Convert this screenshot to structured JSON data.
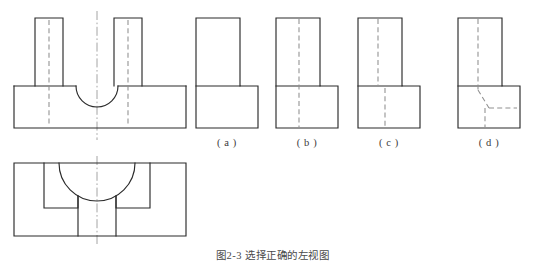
{
  "figure": {
    "type": "engineering-orthographic-projection-exercise",
    "caption": "图2-3  选择正确的左视图",
    "caption_visible": "partially-cropped-at-bottom-edge",
    "line_styles": {
      "visible_edge": "#2b2b2b",
      "hidden_edge_dashed": "#8f8f8f",
      "center_line_dash_dot": "#9a9a9a",
      "background": "#ffffff"
    }
  },
  "given_views": {
    "front_view": {
      "name": "front-view",
      "description": "Block with rectangular uprights and a semicircular U-slot between them",
      "base": {
        "x": 14,
        "y": 86,
        "width": 172,
        "height": 42
      },
      "left_upright": {
        "x": 35,
        "y": 18,
        "width": 28,
        "height": 68
      },
      "right_upright": {
        "x": 114,
        "y": 18,
        "width": 28,
        "height": 68
      },
      "slot_radius": 21,
      "slot_center_x": 97,
      "slot_center_y": 86,
      "hidden_lines_x": [
        49,
        128
      ],
      "center_line_x": 97
    },
    "top_view": {
      "name": "top-view",
      "description": "Top view showing circular slot arc and internal rectangular pocket edges",
      "outline": {
        "x": 14,
        "y": 163,
        "width": 172,
        "height": 73
      },
      "arc_radius": 38,
      "arc_center_x": 97,
      "arc_center_y": 163,
      "pocket_left": {
        "x": 44,
        "y": 163,
        "width": 34,
        "height": 45
      },
      "pocket_right": {
        "x": 116,
        "y": 163,
        "width": 34,
        "height": 45
      },
      "center_line_x": 97
    }
  },
  "options": [
    {
      "id": "a",
      "label": "( a )",
      "name": "option-a",
      "upright": {
        "x": 196,
        "y": 18,
        "width": 44,
        "height": 68
      },
      "base": {
        "x": 196,
        "y": 86,
        "width": 62,
        "height": 42
      },
      "hidden_lines": [],
      "note": "L-shaped outline with no hidden lines"
    },
    {
      "id": "b",
      "label": "( b )",
      "name": "option-b",
      "upright": {
        "x": 276,
        "y": 18,
        "width": 44,
        "height": 68
      },
      "base": {
        "x": 276,
        "y": 86,
        "width": 62,
        "height": 42
      },
      "hidden_lines": [
        {
          "type": "vertical",
          "x": 299,
          "y1": 18,
          "y2": 128
        }
      ],
      "note": "Single full-height vertical hidden line"
    },
    {
      "id": "c",
      "label": "( c )",
      "name": "option-c",
      "upright": {
        "x": 358,
        "y": 18,
        "width": 44,
        "height": 68
      },
      "base": {
        "x": 358,
        "y": 86,
        "width": 62,
        "height": 42
      },
      "hidden_lines": [
        {
          "type": "vertical",
          "x": 378,
          "y1": 18,
          "y2": 86
        },
        {
          "type": "vertical",
          "x": 385,
          "y1": 86,
          "y2": 128
        }
      ],
      "note": "Vertical hidden line in upright, offset hidden line in base"
    },
    {
      "id": "d",
      "label": "( d )",
      "name": "option-d",
      "upright": {
        "x": 458,
        "y": 18,
        "width": 44,
        "height": 68
      },
      "base": {
        "x": 458,
        "y": 86,
        "width": 62,
        "height": 42
      },
      "hidden_lines": [
        {
          "type": "vertical",
          "x": 478,
          "y1": 18,
          "y2": 88
        },
        {
          "type": "diagonal",
          "x1": 478,
          "y1": 88,
          "x2": 488,
          "y2": 108
        },
        {
          "type": "horizontal",
          "x": 488,
          "y": 108,
          "x2": 516
        },
        {
          "type": "vertical",
          "x": 485,
          "y1": 108,
          "y2": 128
        }
      ],
      "note": "Vertical hidden line transitioning to angled and horizontal hidden lines in base"
    }
  ]
}
